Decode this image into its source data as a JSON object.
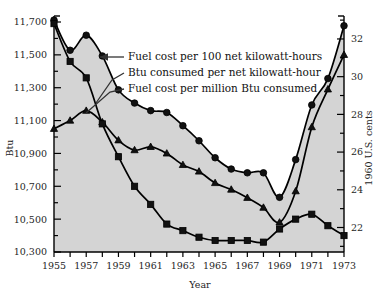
{
  "chart_data": {
    "type": "line",
    "title": "",
    "xlabel": "Year",
    "ylabel": "Btu",
    "y2label": "1960 U.S. cents",
    "grid": false,
    "legend_position": "inside-upper-right",
    "x": [
      1955,
      1956,
      1957,
      1958,
      1959,
      1960,
      1961,
      1962,
      1963,
      1964,
      1965,
      1966,
      1967,
      1968,
      1969,
      1970,
      1971,
      1972,
      1973
    ],
    "xticks": [
      1955,
      1956,
      1957,
      1958,
      1959,
      1960,
      1961,
      1962,
      1963,
      1964,
      1965,
      1966,
      1967,
      1968,
      1969,
      1970,
      1971,
      1972,
      1973
    ],
    "xtick_labels": [
      "1955",
      "",
      "1957",
      "",
      "1959",
      "",
      "1961",
      "",
      "1963",
      "",
      "1965",
      "",
      "1967",
      "",
      "1969",
      "",
      "1971",
      "",
      "1973"
    ],
    "xlim": [
      1955,
      1973
    ],
    "ylim": [
      10300,
      11700
    ],
    "yticks": [
      10300,
      10500,
      10700,
      10900,
      11100,
      11300,
      11500,
      11700
    ],
    "ytick_labels": [
      "10,300",
      "10,500",
      "10,700",
      "10,900",
      "11,100",
      "11,300",
      "11,500",
      "11,700"
    ],
    "yminor_step": 100,
    "y2lim": [
      20.7,
      32.9
    ],
    "y2ticks": [
      22,
      24,
      26,
      28,
      30,
      32
    ],
    "y2tick_labels": [
      "22",
      "24",
      "26",
      "28",
      "30",
      "32"
    ],
    "y2minor_step": 1,
    "fill_color": "#d4d4d4",
    "line_color": "#000000",
    "series": [
      {
        "name": "Fuel cost per 100 net kilowatt-hours",
        "marker": "circle",
        "axis": "right",
        "values": [
          33.0,
          31.4,
          32.2,
          31.1,
          29.3,
          28.6,
          28.2,
          28.1,
          27.4,
          26.6,
          25.7,
          25.1,
          24.9,
          24.9,
          23.6,
          25.6,
          28.5,
          29.9,
          32.7
        ]
      },
      {
        "name": "Btu consumed per net kilowatt-hour",
        "marker": "triangle",
        "axis": "left",
        "values": [
          11050,
          11100,
          11160,
          11090,
          10980,
          10920,
          10940,
          10900,
          10830,
          10790,
          10720,
          10680,
          10630,
          10570,
          10480,
          10670,
          11060,
          11290,
          11500
        ]
      },
      {
        "name": "Fuel cost per million Btu consumed",
        "marker": "square",
        "axis": "left",
        "values": [
          11690,
          11460,
          11360,
          11080,
          10880,
          10700,
          10590,
          10470,
          10430,
          10390,
          10370,
          10370,
          10370,
          10360,
          10440,
          10500,
          10530,
          10460,
          10400
        ]
      }
    ]
  },
  "legend": {
    "items": [
      {
        "label": "Fuel cost per 100 net kilowatt-hours"
      },
      {
        "label": "Btu consumed per net kilowatt-hour"
      },
      {
        "label": "Fuel cost per million Btu consumed"
      }
    ]
  },
  "axes": {
    "left_title": "Btu",
    "right_title": "1960 U.S. cents",
    "bottom_title": "Year"
  }
}
